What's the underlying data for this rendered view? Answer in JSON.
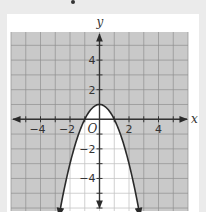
{
  "chart_data": {
    "type": "line",
    "title": "",
    "function": "y = -x^2 + 1",
    "inequality": "y <= -x^2 + 1 region outside parabola shaded",
    "shaded_region": "outside",
    "vertex": [
      0,
      1
    ],
    "x_intercepts": [
      -1,
      1
    ],
    "xlabel": "x",
    "ylabel": "y",
    "origin_label": "O",
    "xlim": [
      -6,
      6
    ],
    "ylim": [
      -6.2,
      5.9
    ],
    "grid": true,
    "x_ticks": [
      {
        "value": -4,
        "label": "−4"
      },
      {
        "value": -2,
        "label": "−2"
      },
      {
        "value": 2,
        "label": "2"
      },
      {
        "value": 4,
        "label": "4"
      }
    ],
    "y_ticks": [
      {
        "value": 4,
        "label": "4"
      },
      {
        "value": 2,
        "label": "2"
      },
      {
        "value": -2,
        "label": "−2"
      },
      {
        "value": -4,
        "label": "−4"
      }
    ],
    "colors": {
      "shade": "#c9c9c9",
      "grid_shaded": "#8f8f8f",
      "grid_unshaded": "#c4c4c4",
      "curve": "#2a2a2a",
      "axis": "#333333"
    }
  }
}
